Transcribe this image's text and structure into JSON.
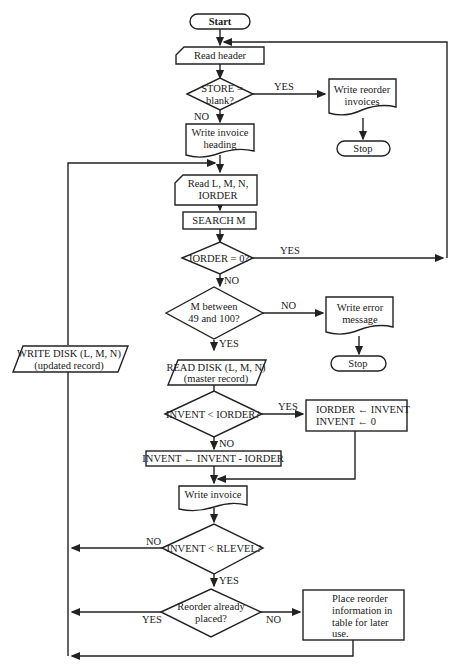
{
  "colors": {
    "stroke": "#222222",
    "background": "#ffffff",
    "text": "#1a1a1a"
  },
  "nodes": {
    "start": "Start",
    "read_header": "Read header",
    "store_blank": [
      "STORE =",
      "blank?"
    ],
    "write_reorder": [
      "Write reorder",
      "invoices"
    ],
    "stop1": "Stop",
    "write_heading": [
      "Write invoice",
      "heading"
    ],
    "read_lmn": [
      "Read  L, M, N,",
      "IORDER"
    ],
    "search_m": "SEARCH M",
    "iorder_zero": "IORDER = 0?",
    "m_between": [
      "M between",
      "49 and 100?"
    ],
    "write_error": [
      "Write error",
      "message"
    ],
    "stop2": "Stop",
    "read_disk": [
      "READ DISK (L, M, N)",
      "(master record)"
    ],
    "write_disk": [
      "WRITE DISK (L, M, N)",
      "(updated record)"
    ],
    "invent_lt_iorder": "INVENT < IORDER?",
    "assign_box": [
      "IORDER  ←  INVENT",
      "INVENT  ←  0"
    ],
    "subtract_box": "INVENT  ←  INVENT - IORDER",
    "write_invoice": "Write invoice",
    "invent_lt_rlevel": "INVENT < RLEVEL?",
    "reorder_placed": [
      "Reorder already",
      "placed?"
    ],
    "place_reorder": [
      "Place reorder",
      "information in",
      "table for later",
      "use."
    ]
  },
  "edge_labels": {
    "store_yes": "YES",
    "store_no": "NO",
    "iorder_yes": "YES",
    "iorder_no": "NO",
    "m_no": "NO",
    "m_yes": "YES",
    "invent_yes": "YES",
    "invent_no": "NO",
    "rlevel_no": "NO",
    "rlevel_yes": "YES",
    "placed_yes": "YES",
    "placed_no": "NO"
  }
}
